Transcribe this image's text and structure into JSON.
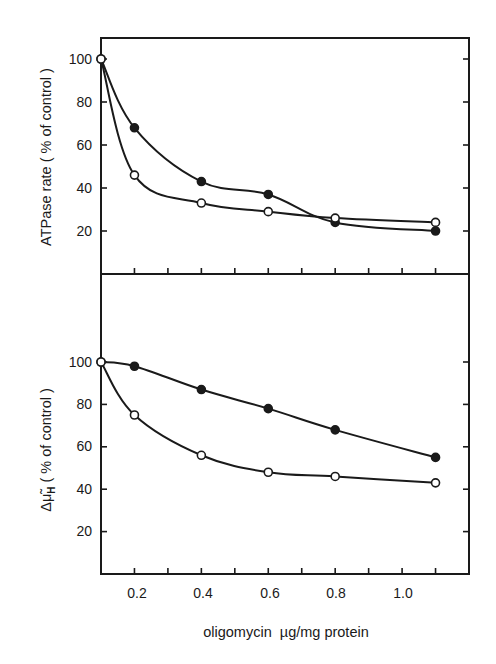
{
  "chart_data": [
    {
      "type": "line",
      "panel": "top",
      "title": "",
      "xlabel": "oligomycin  µg/mg protein",
      "ylabel": "ATPase rate ( % of control )",
      "xlim": [
        0.1,
        1.2
      ],
      "ylim": [
        0,
        110
      ],
      "yticks": [
        20,
        40,
        60,
        80,
        100
      ],
      "grid": false,
      "legend": null,
      "series": [
        {
          "name": "filled circles",
          "marker": "filled",
          "x": [
            0.1,
            0.2,
            0.4,
            0.6,
            0.8,
            1.1
          ],
          "y": [
            100,
            68,
            43,
            37,
            24,
            20
          ]
        },
        {
          "name": "open circles",
          "marker": "open",
          "x": [
            0.1,
            0.2,
            0.4,
            0.6,
            0.8,
            1.1
          ],
          "y": [
            100,
            46,
            33,
            29,
            26,
            24
          ]
        }
      ]
    },
    {
      "type": "line",
      "panel": "bottom",
      "title": "",
      "xlabel": "oligomycin  µg/mg protein",
      "ylabel": "Δμ̃H ( % of control )",
      "xlim": [
        0.1,
        1.2
      ],
      "ylim": [
        0,
        110
      ],
      "yticks": [
        20,
        40,
        60,
        80,
        100
      ],
      "xticks": [
        0.2,
        0.4,
        0.6,
        0.8,
        1.0
      ],
      "grid": false,
      "legend": null,
      "series": [
        {
          "name": "filled circles",
          "marker": "filled",
          "x": [
            0.1,
            0.2,
            0.4,
            0.6,
            0.8,
            1.1
          ],
          "y": [
            100,
            98,
            87,
            78,
            68,
            55
          ]
        },
        {
          "name": "open circles",
          "marker": "open",
          "x": [
            0.1,
            0.2,
            0.4,
            0.6,
            0.8,
            1.1
          ],
          "y": [
            100,
            75,
            56,
            48,
            46,
            43
          ]
        }
      ]
    }
  ],
  "labels": {
    "top_ylabel": "ATPase rate ( % of control )",
    "bottom_ylabel_prefix": "Δμ̃",
    "bottom_ylabel_sub": "H",
    "bottom_ylabel_suffix": " ( % of control )",
    "xlabel": "oligomycin  µg/mg protein",
    "ytick_labels": [
      "100",
      "80",
      "60",
      "40",
      "20"
    ],
    "xtick_labels": [
      "0.2",
      "0.4",
      "0.6",
      "0.8",
      "1.0"
    ]
  },
  "colors": {
    "ink": "#1a1a1a",
    "background": "#ffffff"
  }
}
